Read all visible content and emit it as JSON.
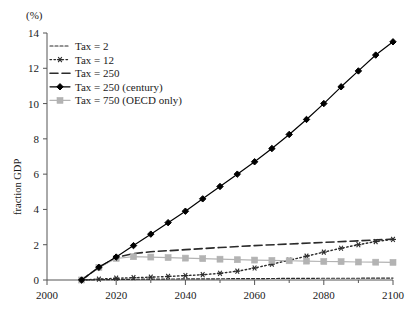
{
  "chart_data": {
    "type": "line",
    "title": "",
    "xlabel": "",
    "ylabel": "fraction GDP",
    "yunit": "(%)",
    "xlim": [
      2000,
      2100
    ],
    "ylim": [
      0,
      14
    ],
    "ytick_values": [
      0,
      2,
      4,
      6,
      8,
      10,
      12,
      14
    ],
    "ytick_labels": [
      "0",
      "2",
      "4",
      "6",
      "8",
      "10",
      "12",
      "14"
    ],
    "xtick_values": [
      2000,
      2020,
      2040,
      2060,
      2080,
      2100
    ],
    "xtick_labels": [
      "2000",
      "2020",
      "2040",
      "2060",
      "2080",
      "2100"
    ],
    "xminor_tick_values": [
      2010,
      2030,
      2050,
      2070,
      2090
    ],
    "grid": false,
    "legend_position": "upper-left",
    "series": [
      {
        "name": "Tax = 2",
        "style": "fine-dashed",
        "marker": "none",
        "color": "#2b2b2b",
        "x": [
          2010,
          2020,
          2030,
          2040,
          2050,
          2060,
          2070,
          2080,
          2090,
          2100
        ],
        "values": [
          0.0,
          0.03,
          0.05,
          0.06,
          0.07,
          0.08,
          0.09,
          0.1,
          0.1,
          0.11
        ]
      },
      {
        "name": "Tax = 12",
        "style": "dotted",
        "marker": "star",
        "color": "#2b2b2b",
        "x": [
          2010,
          2015,
          2020,
          2025,
          2030,
          2035,
          2040,
          2045,
          2050,
          2055,
          2060,
          2065,
          2070,
          2075,
          2080,
          2085,
          2090,
          2095,
          2100
        ],
        "values": [
          0.0,
          0.05,
          0.1,
          0.13,
          0.16,
          0.2,
          0.25,
          0.3,
          0.38,
          0.5,
          0.68,
          0.9,
          1.12,
          1.35,
          1.58,
          1.8,
          2.0,
          2.18,
          2.3
        ]
      },
      {
        "name": "Tax = 250",
        "style": "long-dashed",
        "marker": "none",
        "color": "#2b2b2b",
        "x": [
          2010,
          2015,
          2020,
          2025,
          2030,
          2040,
          2050,
          2060,
          2070,
          2080,
          2090,
          2100
        ],
        "values": [
          0.0,
          0.72,
          1.28,
          1.5,
          1.6,
          1.72,
          1.84,
          1.95,
          2.04,
          2.13,
          2.22,
          2.32
        ]
      },
      {
        "name": "Tax = 250 (century)",
        "style": "solid",
        "marker": "diamond",
        "color": "#000000",
        "x": [
          2010,
          2015,
          2020,
          2025,
          2030,
          2035,
          2040,
          2045,
          2050,
          2055,
          2060,
          2065,
          2070,
          2075,
          2080,
          2085,
          2090,
          2095,
          2100
        ],
        "values": [
          0.0,
          0.72,
          1.3,
          1.95,
          2.6,
          3.25,
          3.9,
          4.6,
          5.3,
          6.0,
          6.7,
          7.45,
          8.25,
          9.1,
          10.0,
          10.95,
          11.85,
          12.75,
          13.5
        ]
      },
      {
        "name": "Tax = 750 (OECD only)",
        "style": "solid",
        "marker": "square",
        "color": "#b3b3b3",
        "x": [
          2010,
          2015,
          2020,
          2025,
          2030,
          2035,
          2040,
          2045,
          2050,
          2055,
          2060,
          2065,
          2070,
          2075,
          2080,
          2085,
          2090,
          2095,
          2100
        ],
        "values": [
          0.0,
          0.72,
          1.22,
          1.32,
          1.3,
          1.27,
          1.24,
          1.21,
          1.18,
          1.15,
          1.13,
          1.11,
          1.09,
          1.07,
          1.05,
          1.04,
          1.02,
          1.01,
          1.0
        ]
      }
    ]
  }
}
